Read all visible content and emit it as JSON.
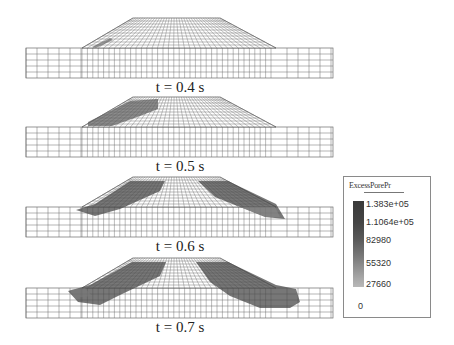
{
  "figure": {
    "panels": [
      {
        "label": "t = 0.4 s",
        "time_s": 0.4,
        "offset_y": 0
      },
      {
        "label": "t = 0.5 s",
        "time_s": 0.5,
        "offset_y": 79
      },
      {
        "label": "t = 0.6 s",
        "time_s": 0.6,
        "offset_y": 159
      },
      {
        "label": "t = 0.7 s",
        "time_s": 0.7,
        "offset_y": 240
      }
    ]
  },
  "legend": {
    "title": "ExcessPorePr",
    "ticks": [
      "1.383e+05",
      "1.1064e+05",
      "82980",
      "55320",
      "27660",
      "0"
    ],
    "colors": {
      "max": "#3a3a3a",
      "min": "#b8b8b8"
    }
  }
}
